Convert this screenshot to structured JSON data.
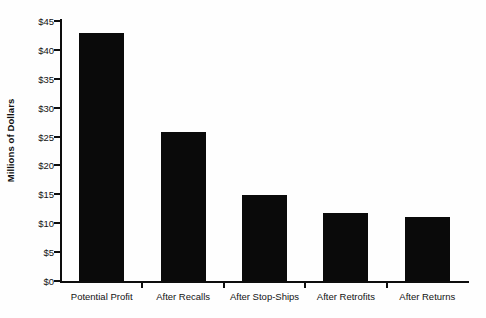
{
  "chart_data": {
    "type": "bar",
    "title": "",
    "subtitle": "",
    "xlabel": "",
    "ylabel": "Millions of Dollars",
    "categories": [
      "Potential Profit",
      "After Recalls",
      "After Stop-Ships",
      "After Retrofits",
      "After Returns"
    ],
    "values": [
      43.0,
      25.8,
      14.9,
      11.8,
      11.1
    ],
    "ylim": [
      0,
      45
    ],
    "ytick_values": [
      0,
      5,
      10,
      15,
      20,
      25,
      30,
      35,
      40,
      45
    ],
    "ytick_labels": [
      "$0",
      "$5",
      "$10",
      "$15",
      "$20",
      "$25",
      "$30",
      "$35",
      "$40",
      "$45"
    ],
    "grid": false,
    "legend": false,
    "legend_position": "none",
    "bar_color": "#0a0a0a",
    "axis_color": "#0d0d0d",
    "background_color": "#fefefe",
    "annotations": []
  },
  "axes": {
    "y_title": "Millions of Dollars"
  }
}
